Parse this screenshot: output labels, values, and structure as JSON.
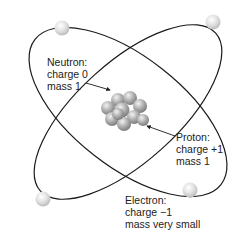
{
  "diagram": {
    "labels": {
      "neutron": {
        "name": "Neutron:",
        "charge": "charge 0",
        "mass": "mass 1"
      },
      "proton": {
        "name": "Proton:",
        "charge": "charge +1",
        "mass": "mass 1"
      },
      "electron": {
        "name": "Electron:",
        "charge": "charge −1",
        "mass": "mass very small"
      }
    },
    "colors": {
      "orbit": "#1a1a1a",
      "electron": "#d9d9d9",
      "nucleus": "#a6a6a6",
      "text": "#222222",
      "background": "#ffffff"
    },
    "electron_count": 4,
    "orbit_count": 2
  }
}
